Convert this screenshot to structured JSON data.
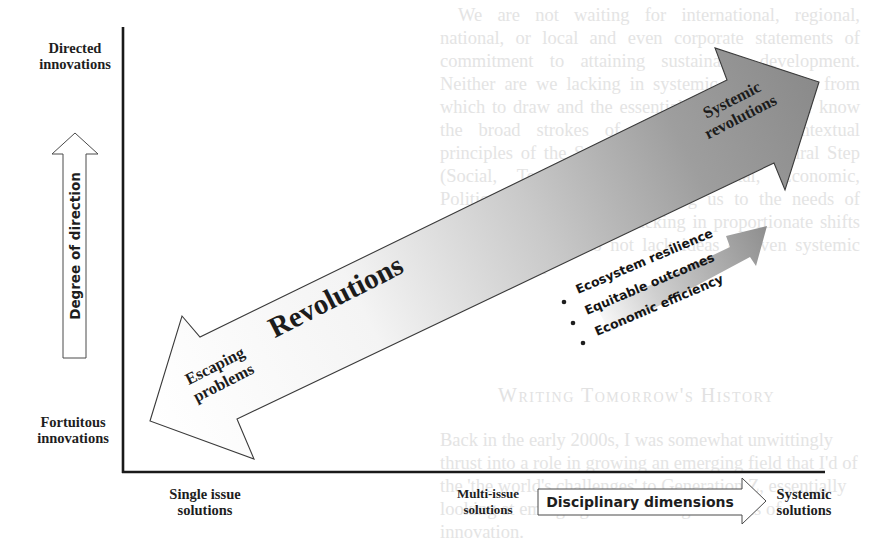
{
  "background_text": {
    "para1": "We are not waiting for international, regional, national, or local and even corporate statements of commitment to attaining sustainable development. Neither are we lacking in systemic frameworks from which to draw and the essential services that we know the broad strokes of the fundamental contextual principles of the Systems Approach. The Natural Step (Social, Technological, Environmental, Economic, Political) offers many informing us to the needs of resilience. While we are lacking in proportionate shifts in real terms, we do not lack ideas or even systemic innovation yet",
    "heading": "Writing Tomorrow's History",
    "para2": "Back in the early 2000s, I was somewhat unwittingly thrust into a role in growing an emerging field that I'd of the 'the world's challenges' to Generation Z, essentially looking at emerging issues through the lens of innovation.",
    "para2_cont": "community involvement in the collective challenges to impact the future"
  },
  "axes": {
    "y_top_label": "Directed innovations",
    "y_bottom_label": "Fortuitous innovations",
    "y_arrow_label": "Degree of direction",
    "x_left_label": "Single issue solutions",
    "x_mid_label": "Multi-issue solutions",
    "x_right_label": "Systemic solutions",
    "x_arrow_label": "Disciplinary dimensions"
  },
  "main_arrow": {
    "center_label": "Revolutions",
    "head_label_line1": "Systemic",
    "head_label_line2": "revolutions",
    "tail_label_line1": "Escaping",
    "tail_label_line2": "problems"
  },
  "outcomes": {
    "items": [
      "Ecosystem resilience",
      "Equitable outcomes",
      "Economic efficiency"
    ]
  },
  "colors": {
    "arrow_dark": "#8c8c8c",
    "arrow_light": "#ffffff",
    "axis": "#1a1a1a",
    "outline": "#3a3a3a"
  }
}
